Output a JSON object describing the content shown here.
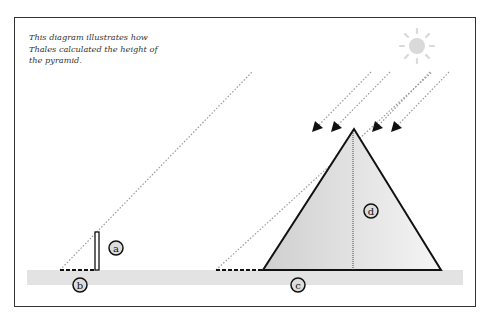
{
  "caption": "This diagram illustrates how Thales calculated the height of the pyramid.",
  "labels": {
    "a": "a",
    "b": "b",
    "c": "c",
    "d": "d"
  },
  "colors": {
    "frame": "#333333",
    "ground": "#e3e3e3",
    "sun": "#d9d9d9",
    "ray": "#9a9a9a",
    "pyramid_fill_left": "#d4d4d4",
    "pyramid_fill_right": "#f3f3f3",
    "stroke": "#111111"
  },
  "legend": {
    "a": "stick height",
    "b": "stick shadow",
    "c": "pyramid shadow",
    "d": "pyramid height"
  }
}
